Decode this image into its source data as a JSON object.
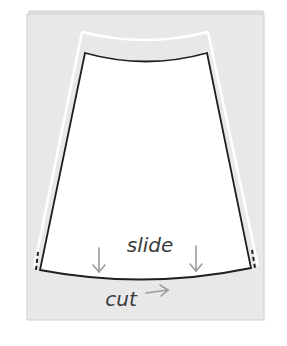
{
  "diagram": {
    "labels": {
      "slide": "slide",
      "cut": "cut"
    },
    "icons": {
      "slide_arrows": "arrow-down",
      "cut_arrow": "arrow-right"
    },
    "colors": {
      "background": "#ffffff",
      "paper": "#e8e8e8",
      "paper_border": "#cfcfcf",
      "pattern_fill": "#ffffff",
      "outline": "#1f1f1f",
      "guide_line": "#ffffff",
      "arrow": "#9a9a9a",
      "text": "#3a3a3a"
    }
  }
}
